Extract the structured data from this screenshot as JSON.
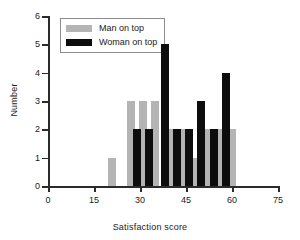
{
  "chart_data": {
    "type": "bar",
    "title": "",
    "xlabel": "Satisfaction score",
    "ylabel": "Number",
    "xlim": [
      0,
      75
    ],
    "ylim": [
      0,
      6
    ],
    "xticks": [
      0,
      15,
      30,
      45,
      60,
      75
    ],
    "yticks": [
      0,
      1,
      2,
      3,
      4,
      5,
      6
    ],
    "grid": false,
    "legend_position": "top-left",
    "colors": {
      "man": "#b4b4b4",
      "woman": "#0d0d0d",
      "axis": "#2b2b2b",
      "background": "#ffffff"
    },
    "series": [
      {
        "name": "Man on top",
        "color": "#b4b4b4",
        "x": [
          21,
          27,
          31,
          35,
          40,
          44,
          48,
          52,
          56,
          60
        ],
        "values": [
          1,
          3,
          3,
          3,
          2,
          2,
          1,
          2,
          2,
          2
        ]
      },
      {
        "name": "Woman on top",
        "color": "#0d0d0d",
        "x": [
          29,
          33,
          38,
          42,
          46,
          50,
          54,
          58
        ],
        "values": [
          2,
          2,
          5,
          2,
          2,
          3,
          2,
          4
        ]
      }
    ]
  },
  "legend": {
    "items": [
      {
        "label": "Man on top",
        "key": "man"
      },
      {
        "label": "Woman on top",
        "key": "woman"
      }
    ]
  }
}
